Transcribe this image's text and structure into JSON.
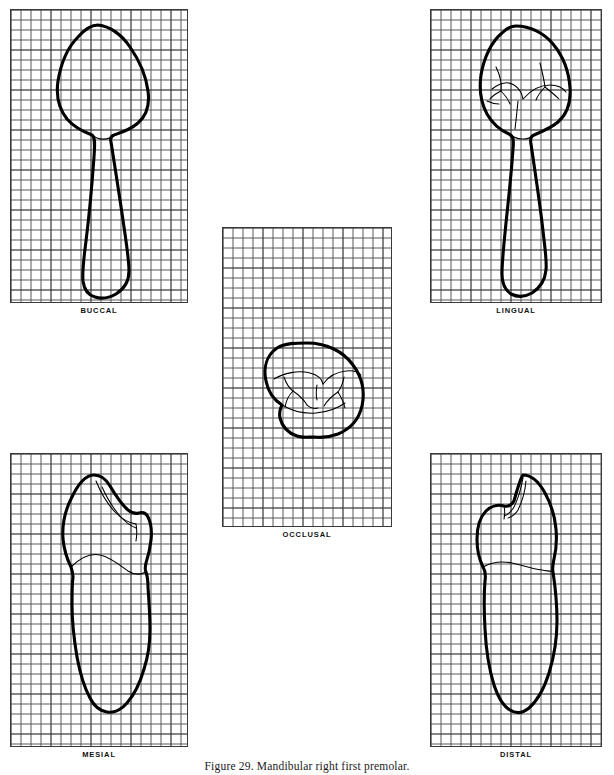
{
  "figure": {
    "caption": "Figure 29. Mandibular right first premolar.",
    "caption_top_px": 760
  },
  "panels": [
    {
      "key": "buccal",
      "label": "BUCCAL",
      "x": 10,
      "y": 9,
      "w": 178,
      "h": 294,
      "label_y": 306,
      "grid": {
        "cell_px": 10,
        "cols": 18,
        "rows": 29,
        "major_every": 4
      }
    },
    {
      "key": "lingual",
      "label": "LINGUAL",
      "x": 430,
      "y": 9,
      "w": 172,
      "h": 294,
      "label_y": 306,
      "grid": {
        "cell_px": 10,
        "cols": 17,
        "rows": 29,
        "major_every": 4
      }
    },
    {
      "key": "occlusal",
      "label": "OCCLUSAL",
      "x": 222,
      "y": 227,
      "w": 170,
      "h": 300,
      "label_y": 530,
      "grid": {
        "cell_px": 10,
        "cols": 17,
        "rows": 30,
        "major_every": 4
      }
    },
    {
      "key": "mesial",
      "label": "MESIAL",
      "x": 10,
      "y": 453,
      "w": 178,
      "h": 294,
      "label_y": 750,
      "grid": {
        "cell_px": 10,
        "cols": 18,
        "rows": 29,
        "major_every": 4
      }
    },
    {
      "key": "distal",
      "label": "DISTAL",
      "x": 430,
      "y": 453,
      "w": 172,
      "h": 294,
      "label_y": 750,
      "grid": {
        "cell_px": 10,
        "cols": 17,
        "rows": 29,
        "major_every": 4
      }
    }
  ],
  "colors": {
    "background": "#ffffff",
    "grid_minor": "#5a5a5a",
    "grid_major": "#1e1e1e",
    "panel_border": "#3a3a3a",
    "outline": "#000000",
    "text": "#111111"
  },
  "subject": {
    "tooth": "Mandibular right first premolar",
    "views": [
      "BUCCAL",
      "LINGUAL",
      "OCCLUSAL",
      "MESIAL",
      "DISTAL"
    ],
    "view_count": 5
  }
}
